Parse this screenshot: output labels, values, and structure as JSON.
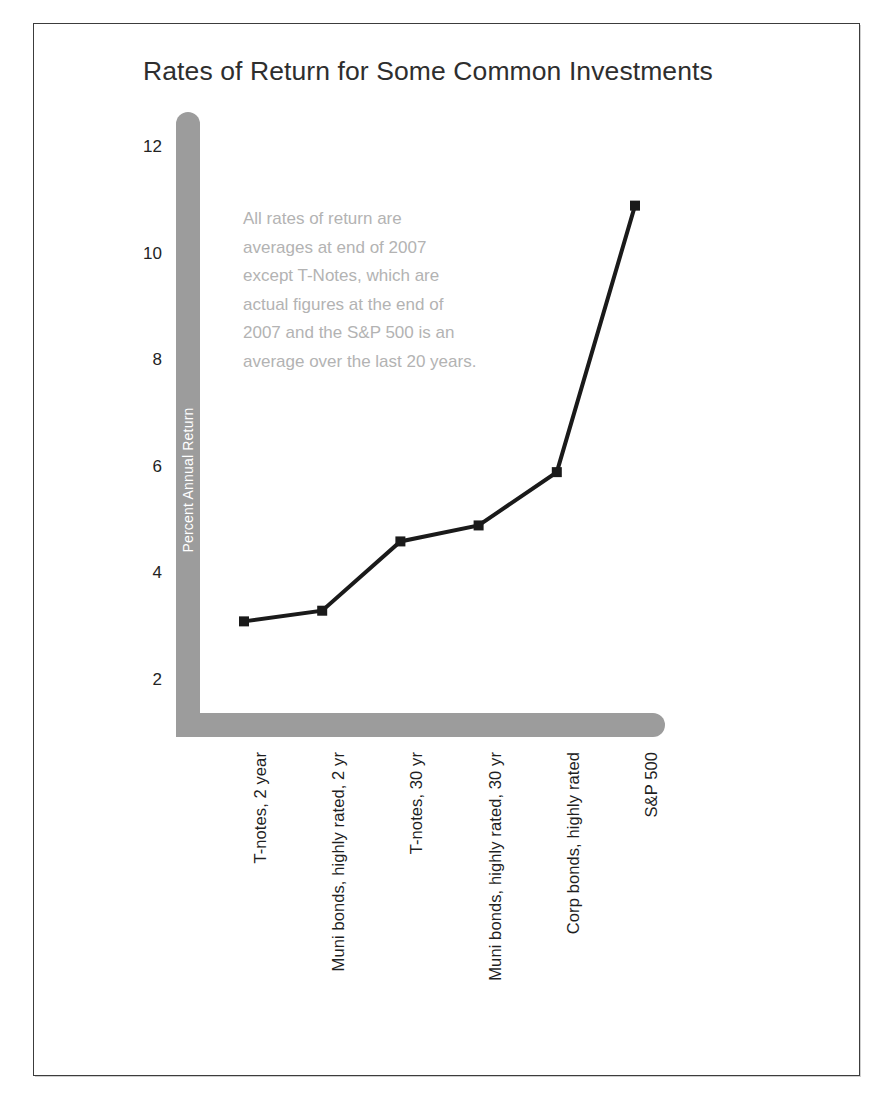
{
  "page": {
    "title": "Rates of Return for Some Common Investments",
    "background": "#ffffff",
    "frame_color": "#3c3c3c"
  },
  "colors": {
    "axis_gray": "#9c9c9c",
    "series_black": "#1a1a1a",
    "title_text": "#2e2e2e",
    "tick_text": "#232323",
    "annotation_text": "#b3b3b3",
    "axis_title_text": "#ffffff"
  },
  "annotation": {
    "lines": [
      "All rates of return are",
      "averages at end of 2007",
      "except T-Notes, which are",
      "actual figures at the end of",
      "2007 and the S&P 500 is an",
      "average over the last 20 years."
    ],
    "full_text": "All rates of return are averages at end of 2007 except T-Notes, which are actual figures at the end of 2007 and the S&P 500 is an average over the last 20 years."
  },
  "chart_data": {
    "type": "line",
    "title": "Rates of Return for Some Common Investments",
    "xlabel": "",
    "ylabel": "Percent Annual Return",
    "categories": [
      "T-notes, 2 year",
      "Muni bonds, highly rated, 2 yr",
      "T-notes, 30 yr",
      "Muni bonds, highly rated, 30 yr",
      "Corp bonds, highly rated",
      "S&P 500"
    ],
    "values": [
      3.1,
      3.3,
      4.6,
      4.9,
      5.9,
      10.9
    ],
    "ylim": [
      0,
      12.7
    ],
    "yticks": [
      2,
      4,
      6,
      8,
      10,
      12
    ],
    "ytick_labels": [
      "2",
      "4",
      "6",
      "8",
      "10",
      "12"
    ],
    "grid": false,
    "legend": false,
    "marker": "square",
    "line_width": 4
  }
}
